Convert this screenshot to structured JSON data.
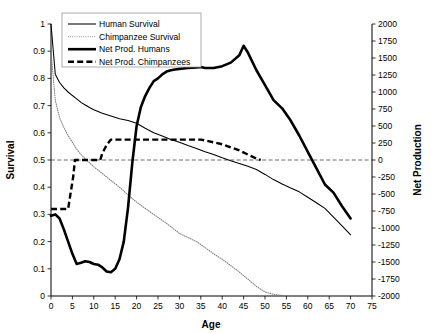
{
  "chart_data": {
    "type": "line",
    "title": "",
    "xlabel": "Age",
    "ylabel": "Survival",
    "y2label": "Net Production",
    "xlim": [
      0,
      75
    ],
    "ylim": [
      0,
      1
    ],
    "y2lim": [
      -2000,
      2000
    ],
    "grid": false,
    "legend_position": "top-left",
    "xticks": [
      "0",
      "5",
      "10",
      "15",
      "20",
      "25",
      "30",
      "35",
      "40",
      "45",
      "50",
      "55",
      "60",
      "65",
      "70",
      "75"
    ],
    "yticks": [
      "0",
      "0.1",
      "0.2",
      "0.3",
      "0.4",
      "0.5",
      "0.6",
      "0.7",
      "0.8",
      "0.9",
      "1"
    ],
    "y2ticks": [
      "-2000",
      "-1750",
      "-1500",
      "-1250",
      "-1000",
      "-750",
      "-500",
      "-250",
      "0",
      "250",
      "500",
      "750",
      "1000",
      "1250",
      "1500",
      "1750",
      "2000"
    ],
    "annotations": [
      "dashed horizontal reference line at Net Production = 0 (Survival = 0.5)"
    ],
    "series": [
      {
        "name": "Human Survival",
        "axis": "left",
        "style": "thin-solid",
        "color": "#000000",
        "x": [
          0,
          1,
          2,
          3,
          4,
          5,
          6,
          7,
          8,
          9,
          10,
          12,
          14,
          16,
          18,
          20,
          22,
          24,
          26,
          28,
          30,
          32,
          34,
          36,
          38,
          40,
          42,
          44,
          46,
          48,
          50,
          52,
          54,
          56,
          58,
          60,
          62,
          64,
          66,
          68,
          70
        ],
        "y": [
          1.0,
          0.815,
          0.785,
          0.765,
          0.75,
          0.737,
          0.725,
          0.712,
          0.702,
          0.693,
          0.685,
          0.672,
          0.662,
          0.652,
          0.645,
          0.635,
          0.617,
          0.6,
          0.588,
          0.575,
          0.565,
          0.553,
          0.542,
          0.53,
          0.52,
          0.508,
          0.497,
          0.487,
          0.477,
          0.465,
          0.447,
          0.428,
          0.412,
          0.397,
          0.383,
          0.363,
          0.343,
          0.322,
          0.29,
          0.258,
          0.225
        ]
      },
      {
        "name": "Chimpanzee Survival",
        "axis": "left",
        "style": "dotted",
        "color": "#777777",
        "x": [
          0,
          1,
          2,
          3,
          4,
          5,
          6,
          7,
          8,
          9,
          10,
          12,
          14,
          16,
          18,
          20,
          22,
          24,
          26,
          28,
          30,
          32,
          34,
          36,
          38,
          40,
          42,
          44,
          46,
          48,
          50,
          52,
          54,
          55
        ],
        "y": [
          0.9,
          0.72,
          0.655,
          0.62,
          0.59,
          0.565,
          0.54,
          0.52,
          0.505,
          0.49,
          0.475,
          0.45,
          0.425,
          0.4,
          0.372,
          0.345,
          0.322,
          0.3,
          0.278,
          0.255,
          0.23,
          0.215,
          0.2,
          0.178,
          0.155,
          0.135,
          0.112,
          0.088,
          0.062,
          0.035,
          0.015,
          0.006,
          0.002,
          0.0
        ]
      },
      {
        "name": "Net Prod. Humans",
        "axis": "right",
        "style": "thick-solid",
        "color": "#000000",
        "x": [
          0,
          1,
          2,
          3,
          4,
          5,
          6,
          7,
          8,
          9,
          10,
          11,
          12,
          13,
          14,
          15,
          16,
          17,
          18,
          19,
          20,
          21,
          22,
          23,
          24,
          25,
          26,
          27,
          28,
          29,
          30,
          32,
          34,
          35,
          36,
          38,
          40,
          42,
          44,
          45,
          46,
          48,
          50,
          52,
          54,
          56,
          58,
          60,
          62,
          64,
          66,
          68,
          70
        ],
        "y_survival_equivalent": [
          0.295,
          0.3,
          0.285,
          0.245,
          0.2,
          0.155,
          0.118,
          0.122,
          0.128,
          0.125,
          0.118,
          0.115,
          0.105,
          0.09,
          0.088,
          0.1,
          0.135,
          0.2,
          0.325,
          0.49,
          0.625,
          0.695,
          0.735,
          0.765,
          0.79,
          0.8,
          0.815,
          0.825,
          0.83,
          0.833,
          0.835,
          0.838,
          0.84,
          0.842,
          0.838,
          0.838,
          0.845,
          0.858,
          0.885,
          0.92,
          0.895,
          0.83,
          0.775,
          0.72,
          0.69,
          0.645,
          0.59,
          0.53,
          0.47,
          0.41,
          0.38,
          0.33,
          0.285
        ],
        "y": [
          -820,
          -800,
          -860,
          -1020,
          -1200,
          -1380,
          -1530,
          -1512,
          -1488,
          -1500,
          -1530,
          -1540,
          -1580,
          -1640,
          -1650,
          -1600,
          -1460,
          -1200,
          -700,
          -40,
          500,
          780,
          940,
          1060,
          1160,
          1200,
          1260,
          1300,
          1320,
          1332,
          1340,
          1352,
          1360,
          1368,
          1352,
          1352,
          1380,
          1432,
          1540,
          1680,
          1580,
          1320,
          1100,
          880,
          760,
          580,
          360,
          120,
          -120,
          -360,
          -480,
          -680,
          -860
        ]
      },
      {
        "name": "Net Prod. Chimpanzees",
        "axis": "right",
        "style": "thick-dashed",
        "color": "#000000",
        "x": [
          0,
          4,
          4.6,
          5.2,
          5.6,
          11.5,
          12,
          13,
          14,
          15,
          20,
          25,
          30,
          35,
          36,
          40,
          44,
          48,
          49
        ],
        "y_survival_equivalent": [
          0.32,
          0.32,
          0.38,
          0.44,
          0.5,
          0.5,
          0.525,
          0.555,
          0.575,
          0.575,
          0.575,
          0.575,
          0.575,
          0.575,
          0.572,
          0.558,
          0.535,
          0.505,
          0.5
        ],
        "y": [
          -720,
          -720,
          -480,
          -240,
          0,
          0,
          100,
          220,
          300,
          300,
          300,
          300,
          300,
          300,
          288,
          232,
          140,
          20,
          0
        ]
      }
    ]
  },
  "legend": {
    "entries": [
      {
        "label": "Human Survival",
        "style": "thin-solid"
      },
      {
        "label": "Chimpanzee Survival",
        "style": "dotted"
      },
      {
        "label": "Net Prod. Humans",
        "style": "thick-solid"
      },
      {
        "label": "Net Prod. Chimpanzees",
        "style": "thick-dashed"
      }
    ]
  },
  "axes": {
    "x_title": "Age",
    "y_left_title": "Survival",
    "y_right_title": "Net Production"
  }
}
